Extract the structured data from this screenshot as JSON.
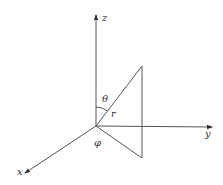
{
  "diagram": {
    "title": "",
    "type": "spherical-coordinate-system",
    "labels": {
      "z_axis": "z",
      "y_axis": "y",
      "x_axis": "x",
      "theta": "θ",
      "radius": "r",
      "phi": "φ"
    },
    "colors": {
      "line": "#555555",
      "text": "#333333",
      "background": "#ffffff"
    }
  }
}
